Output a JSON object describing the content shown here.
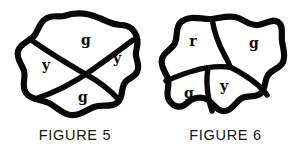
{
  "page": {
    "background_color": "#ffffff",
    "ink_color": "#080808",
    "width": 301,
    "height": 152
  },
  "figures": [
    {
      "id": "figure-5",
      "caption": "FIGURE 5",
      "shape": "irregular-blob",
      "region_count": 4,
      "regions": [
        {
          "name": "top",
          "label": "g",
          "x": 86,
          "y": 41
        },
        {
          "name": "left",
          "label": "y",
          "x": 46,
          "y": 66
        },
        {
          "name": "right",
          "label": "y",
          "x": 117,
          "y": 59
        },
        {
          "name": "bottom",
          "label": "g",
          "x": 83,
          "y": 98
        }
      ]
    },
    {
      "id": "figure-6",
      "caption": "FIGURE 6",
      "shape": "irregular-blob",
      "region_count": 4,
      "regions": [
        {
          "name": "top-left",
          "label": "r",
          "x": 43,
          "y": 42
        },
        {
          "name": "top-right",
          "label": "g",
          "x": 104,
          "y": 44
        },
        {
          "name": "bottom-left",
          "label": "g",
          "x": 39,
          "y": 94
        },
        {
          "name": "bottom-middle",
          "label": "y",
          "x": 74,
          "y": 87
        }
      ]
    }
  ]
}
